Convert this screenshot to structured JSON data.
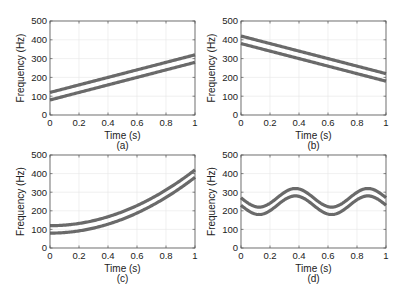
{
  "chart_data": [
    {
      "id": "a",
      "type": "line",
      "caption": "(a)",
      "xlabel": "Time (s)",
      "ylabel": "Frequency (Hz)",
      "xlim": [
        0,
        1
      ],
      "ylim": [
        0,
        500
      ],
      "xticks": [
        "0",
        "0.2",
        "0.4",
        "0.6",
        "0.8",
        "1"
      ],
      "yticks": [
        "0",
        "100",
        "200",
        "300",
        "400",
        "500"
      ],
      "grid": true,
      "description": "Linear up-chirp, two parallel bands ±20 Hz around center",
      "series": [
        {
          "name": "upper band",
          "x": [
            0,
            1
          ],
          "values": [
            120,
            320
          ]
        },
        {
          "name": "lower band",
          "x": [
            0,
            1
          ],
          "values": [
            80,
            280
          ]
        }
      ]
    },
    {
      "id": "b",
      "type": "line",
      "caption": "(b)",
      "xlabel": "Time (s)",
      "ylabel": "Frequency (Hz)",
      "xlim": [
        0,
        1
      ],
      "ylim": [
        0,
        500
      ],
      "xticks": [
        "0",
        "0.2",
        "0.4",
        "0.6",
        "0.8",
        "1"
      ],
      "yticks": [
        "0",
        "100",
        "200",
        "300",
        "400",
        "500"
      ],
      "grid": true,
      "description": "Linear down-chirp, two parallel bands",
      "series": [
        {
          "name": "upper band",
          "x": [
            0,
            1
          ],
          "values": [
            420,
            220
          ]
        },
        {
          "name": "lower band",
          "x": [
            0,
            1
          ],
          "values": [
            380,
            180
          ]
        }
      ]
    },
    {
      "id": "c",
      "type": "line",
      "caption": "(c)",
      "xlabel": "Time (s)",
      "ylabel": "Frequency (Hz)",
      "xlim": [
        0,
        1
      ],
      "ylim": [
        0,
        500
      ],
      "xticks": [
        "0",
        "0.2",
        "0.4",
        "0.6",
        "0.8",
        "1"
      ],
      "yticks": [
        "0",
        "100",
        "200",
        "300",
        "400",
        "500"
      ],
      "grid": true,
      "description": "Quadratic chirp f = 100 + 300 t^2, two bands",
      "series": [
        {
          "name": "upper band",
          "x": [
            0,
            0.2,
            0.4,
            0.6,
            0.8,
            1
          ],
          "values": [
            120,
            132,
            168,
            228,
            312,
            420
          ]
        },
        {
          "name": "lower band",
          "x": [
            0,
            0.2,
            0.4,
            0.6,
            0.8,
            1
          ],
          "values": [
            80,
            92,
            128,
            188,
            272,
            380
          ]
        }
      ]
    },
    {
      "id": "d",
      "type": "line",
      "caption": "(d)",
      "xlabel": "Time (s)",
      "ylabel": "Frequency (Hz)",
      "xlim": [
        0,
        1
      ],
      "ylim": [
        0,
        500
      ],
      "xticks": [
        "0",
        "0.2",
        "0.4",
        "0.6",
        "0.8",
        "1"
      ],
      "yticks": [
        "0",
        "100",
        "200",
        "300",
        "400",
        "500"
      ],
      "grid": true,
      "description": "Sinusoidal FM f = 250 + 50 sin(2π·2t + π/2 shifted), period 0.5 s, two bands",
      "series": [
        {
          "name": "upper band",
          "x": [
            0,
            0.125,
            0.375,
            0.625,
            0.875,
            1
          ],
          "values": [
            270,
            220,
            320,
            220,
            320,
            270
          ]
        },
        {
          "name": "lower band",
          "x": [
            0,
            0.125,
            0.375,
            0.625,
            0.875,
            1
          ],
          "values": [
            230,
            180,
            280,
            180,
            280,
            230
          ]
        }
      ]
    }
  ],
  "colors": {
    "band": "#6a6a6a",
    "axis": "#555555",
    "grid": "#e6e6e6"
  }
}
